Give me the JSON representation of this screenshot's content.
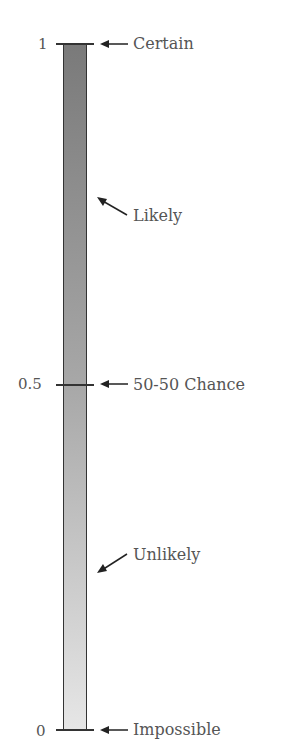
{
  "diagram": {
    "ticks": [
      {
        "value": "1",
        "label": "Certain"
      },
      {
        "value": "0.5",
        "label": "50-50 Chance"
      },
      {
        "value": "0",
        "label": "Impossible"
      }
    ],
    "annotations": [
      {
        "label": "Likely"
      },
      {
        "label": "Unlikely"
      }
    ],
    "colors": {
      "bar_top": "#7a7a7a",
      "bar_bottom": "#e6e6e6",
      "text": "#555555",
      "line": "#333333"
    }
  }
}
